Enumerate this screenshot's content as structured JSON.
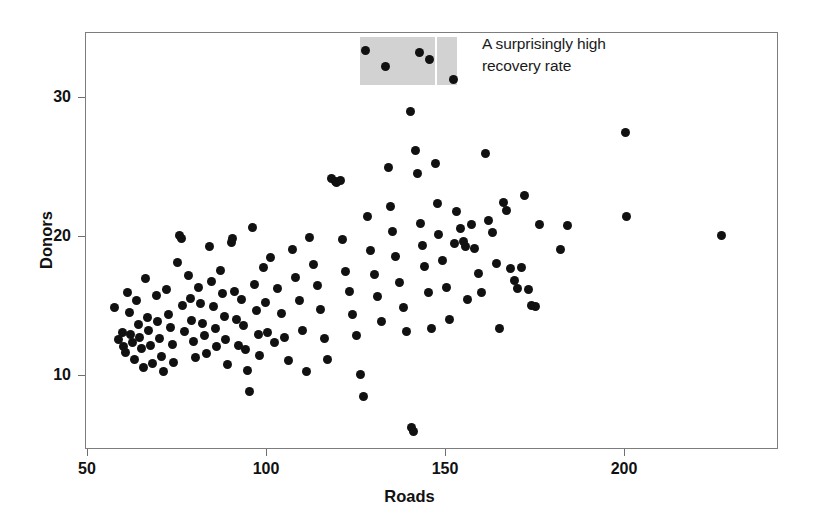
{
  "chart_data": {
    "type": "scatter",
    "title": "",
    "xlabel": "Roads",
    "ylabel": "Donors",
    "xlim": [
      48,
      242
    ],
    "ylim": [
      5,
      34.5
    ],
    "xticks": [
      50,
      100,
      150,
      200
    ],
    "yticks": [
      10,
      20,
      30
    ],
    "xtick_labels": [
      "50",
      "100",
      "150",
      "200"
    ],
    "ytick_labels": [
      "10",
      "20",
      "30"
    ],
    "grid": false,
    "legend": "none",
    "marker": {
      "shape": "circle",
      "color": "#111111",
      "size_px": 9
    },
    "annotations": [
      {
        "text": "A surprisingly high\nrecovery rate",
        "x_px": 482,
        "y_px": 33
      }
    ],
    "highlight_regions": [
      {
        "name": "high-recovery-rate-band",
        "color": "#d2d2d2",
        "x_range": [
          126,
          153
        ],
        "y_range": [
          30.9,
          34.4
        ],
        "divider_x": 147,
        "divider_color": "#ffffff"
      }
    ],
    "points": [
      [
        57.5,
        14.9
      ],
      [
        58.5,
        12.6
      ],
      [
        59.5,
        13.1
      ],
      [
        60.0,
        12.1
      ],
      [
        60.5,
        11.7
      ],
      [
        61.0,
        16.0
      ],
      [
        61.5,
        14.6
      ],
      [
        62.0,
        13.0
      ],
      [
        62.5,
        12.4
      ],
      [
        63.0,
        11.2
      ],
      [
        63.5,
        15.4
      ],
      [
        64.0,
        13.7
      ],
      [
        64.5,
        12.8
      ],
      [
        65.0,
        12.0
      ],
      [
        65.5,
        10.6
      ],
      [
        66.0,
        17.0
      ],
      [
        66.5,
        14.2
      ],
      [
        67.0,
        13.3
      ],
      [
        67.5,
        12.2
      ],
      [
        68.0,
        10.9
      ],
      [
        69.0,
        15.8
      ],
      [
        69.5,
        13.9
      ],
      [
        70.0,
        12.7
      ],
      [
        70.5,
        11.4
      ],
      [
        71.0,
        10.3
      ],
      [
        72.0,
        16.2
      ],
      [
        72.5,
        14.4
      ],
      [
        73.0,
        13.5
      ],
      [
        73.5,
        12.3
      ],
      [
        74.0,
        11.0
      ],
      [
        75.0,
        18.2
      ],
      [
        75.5,
        20.1
      ],
      [
        76.0,
        19.9
      ],
      [
        76.5,
        15.1
      ],
      [
        77.0,
        13.2
      ],
      [
        78.0,
        17.2
      ],
      [
        78.5,
        15.6
      ],
      [
        79.0,
        14.0
      ],
      [
        79.5,
        12.5
      ],
      [
        80.0,
        11.3
      ],
      [
        81.0,
        16.4
      ],
      [
        81.5,
        15.2
      ],
      [
        82.0,
        13.8
      ],
      [
        82.5,
        12.9
      ],
      [
        83.0,
        11.6
      ],
      [
        84.0,
        19.3
      ],
      [
        84.5,
        16.8
      ],
      [
        85.0,
        15.0
      ],
      [
        85.5,
        13.4
      ],
      [
        86.0,
        12.1
      ],
      [
        87.0,
        17.6
      ],
      [
        87.5,
        15.9
      ],
      [
        88.0,
        14.3
      ],
      [
        88.5,
        12.6
      ],
      [
        89.0,
        10.8
      ],
      [
        90.0,
        19.6
      ],
      [
        90.5,
        19.9
      ],
      [
        91.0,
        16.1
      ],
      [
        91.5,
        14.1
      ],
      [
        92.0,
        12.2
      ],
      [
        93.0,
        15.5
      ],
      [
        93.5,
        13.6
      ],
      [
        94.0,
        11.9
      ],
      [
        94.5,
        10.4
      ],
      [
        95.0,
        8.9
      ],
      [
        96.0,
        20.7
      ],
      [
        96.5,
        16.6
      ],
      [
        97.0,
        14.7
      ],
      [
        97.5,
        13.0
      ],
      [
        98.0,
        11.5
      ],
      [
        99.0,
        17.8
      ],
      [
        99.5,
        15.3
      ],
      [
        100.0,
        13.1
      ],
      [
        101.0,
        18.5
      ],
      [
        102.0,
        12.4
      ],
      [
        103.0,
        16.3
      ],
      [
        104.0,
        14.5
      ],
      [
        105.0,
        12.8
      ],
      [
        106.0,
        11.1
      ],
      [
        107.0,
        19.1
      ],
      [
        108.0,
        17.1
      ],
      [
        109.0,
        15.4
      ],
      [
        110.0,
        13.3
      ],
      [
        111.0,
        10.3
      ],
      [
        112.0,
        20.0
      ],
      [
        113.0,
        18.0
      ],
      [
        114.0,
        16.5
      ],
      [
        115.0,
        14.8
      ],
      [
        116.0,
        12.7
      ],
      [
        117.0,
        11.2
      ],
      [
        118.0,
        24.2
      ],
      [
        119.0,
        24.0
      ],
      [
        119.5,
        23.9
      ],
      [
        120.5,
        24.1
      ],
      [
        121.0,
        19.8
      ],
      [
        122.0,
        17.5
      ],
      [
        123.0,
        16.1
      ],
      [
        124.0,
        14.4
      ],
      [
        125.0,
        12.9
      ],
      [
        126.0,
        10.1
      ],
      [
        127.0,
        8.5
      ],
      [
        127.5,
        33.4
      ],
      [
        128.0,
        21.5
      ],
      [
        129.0,
        19.0
      ],
      [
        130.0,
        17.3
      ],
      [
        131.0,
        15.7
      ],
      [
        132.0,
        13.9
      ],
      [
        133.0,
        32.3
      ],
      [
        134.0,
        25.0
      ],
      [
        134.5,
        22.2
      ],
      [
        135.0,
        20.4
      ],
      [
        136.0,
        18.6
      ],
      [
        137.0,
        16.7
      ],
      [
        138.0,
        14.9
      ],
      [
        139.0,
        13.2
      ],
      [
        140.0,
        29.0
      ],
      [
        140.5,
        6.3
      ],
      [
        141.0,
        6.0
      ],
      [
        141.5,
        26.2
      ],
      [
        142.0,
        24.6
      ],
      [
        142.5,
        33.3
      ],
      [
        143.0,
        21.0
      ],
      [
        143.5,
        19.4
      ],
      [
        144.0,
        17.9
      ],
      [
        145.0,
        16.0
      ],
      [
        145.5,
        32.8
      ],
      [
        146.0,
        13.4
      ],
      [
        147.0,
        25.3
      ],
      [
        147.5,
        22.4
      ],
      [
        148.0,
        20.2
      ],
      [
        149.0,
        18.3
      ],
      [
        150.0,
        16.4
      ],
      [
        151.0,
        14.1
      ],
      [
        152.0,
        31.3
      ],
      [
        152.5,
        19.5
      ],
      [
        153.0,
        21.8
      ],
      [
        154.0,
        20.6
      ],
      [
        155.0,
        19.7
      ],
      [
        155.5,
        19.3
      ],
      [
        156.0,
        15.5
      ],
      [
        157.0,
        20.9
      ],
      [
        158.0,
        19.2
      ],
      [
        159.0,
        17.4
      ],
      [
        160.0,
        16.0
      ],
      [
        161.0,
        26.0
      ],
      [
        162.0,
        21.2
      ],
      [
        163.0,
        20.3
      ],
      [
        164.0,
        18.1
      ],
      [
        165.0,
        13.4
      ],
      [
        166.0,
        22.5
      ],
      [
        167.0,
        21.9
      ],
      [
        168.0,
        17.7
      ],
      [
        169.0,
        16.9
      ],
      [
        170.0,
        16.3
      ],
      [
        171.0,
        17.8
      ],
      [
        172.0,
        23.0
      ],
      [
        173.0,
        16.2
      ],
      [
        174.0,
        15.1
      ],
      [
        175.0,
        15.0
      ],
      [
        176.0,
        20.9
      ],
      [
        182.0,
        19.1
      ],
      [
        184.0,
        20.8
      ],
      [
        200.0,
        27.5
      ],
      [
        200.5,
        21.5
      ],
      [
        227.0,
        20.1
      ]
    ]
  }
}
